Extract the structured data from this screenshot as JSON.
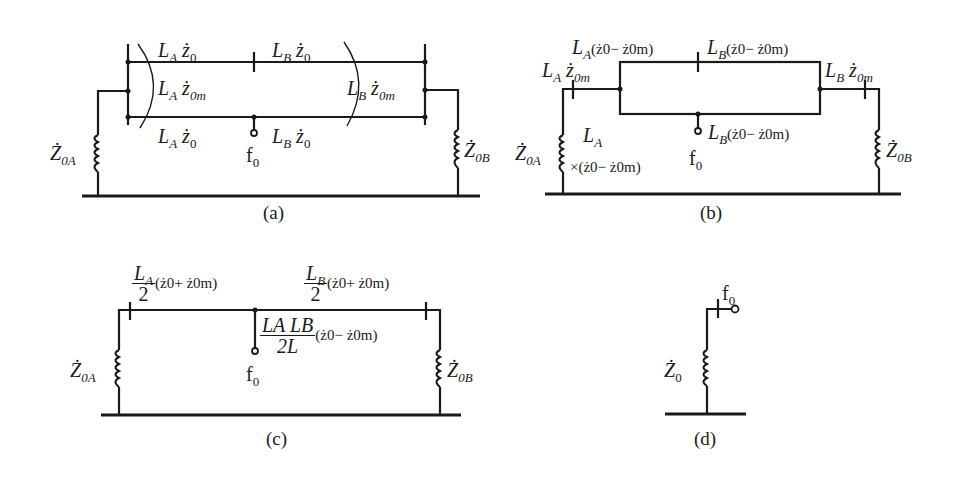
{
  "figure": {
    "panels": [
      {
        "id": "a",
        "caption": "(a)",
        "labels": {
          "top_left": {
            "L": "L",
            "sub": "A",
            "z": "ż",
            "zsub": "0"
          },
          "top_right": {
            "L": "L",
            "sub": "B",
            "z": "ż",
            "zsub": "0"
          },
          "mid_left": {
            "L": "L",
            "sub": "A",
            "z": "ż",
            "zsub": "0m"
          },
          "mid_right": {
            "L": "L",
            "sub": "B",
            "z": "ż",
            "zsub": "0m"
          },
          "bot_left": {
            "L": "L",
            "sub": "A",
            "z": "ż",
            "zsub": "0"
          },
          "bot_right": {
            "L": "L",
            "sub": "B",
            "z": "ż",
            "zsub": "0"
          },
          "fault": "f",
          "fault_sub": "0",
          "source_left": {
            "Z": "Ż",
            "sub": "0A"
          },
          "source_right": {
            "Z": "Ż",
            "sub": "0B"
          }
        }
      },
      {
        "id": "b",
        "caption": "(b)",
        "labels": {
          "top_left": "(ż0− ż0m)",
          "top_right": "(ż0− ż0m)",
          "left_branch": {
            "L": "L",
            "sub": "A",
            "z": "ż",
            "zsub": "0m"
          },
          "right_branch": {
            "L": "L",
            "sub": "B",
            "z": "ż",
            "zsub": "0m"
          },
          "fault_branch": "(ż0− ż0m)",
          "left_shunt_line1": "L",
          "left_shunt_sub": "A",
          "left_shunt_line2": "×(ż0− ż0m)",
          "fault": "f",
          "fault_sub": "0",
          "source_left": {
            "Z": "Ż",
            "sub": "0A"
          },
          "source_right": {
            "Z": "Ż",
            "sub": "0B"
          }
        }
      },
      {
        "id": "c",
        "caption": "(c)",
        "labels": {
          "left_num": "L",
          "left_num_sub": "A",
          "left_den": "2",
          "left_expr": "(ż0+ ż0m)",
          "right_num": "L",
          "right_num_sub": "B",
          "right_den": "2",
          "right_expr": "(ż0+ ż0m)",
          "fault_num": "LA LB",
          "fault_den": "2L",
          "fault_expr": "(ż0− ż0m)",
          "fault": "f",
          "fault_sub": "0",
          "source_left": {
            "Z": "Ż",
            "sub": "0A"
          },
          "source_right": {
            "Z": "Ż",
            "sub": "0B"
          }
        }
      },
      {
        "id": "d",
        "caption": "(d)",
        "labels": {
          "fault": "f",
          "fault_sub": "0",
          "source": {
            "Z": "Ż",
            "sub": "0"
          }
        }
      }
    ]
  }
}
